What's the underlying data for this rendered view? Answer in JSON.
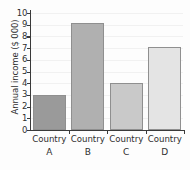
{
  "chart_data": {
    "type": "bar",
    "title": "",
    "subtitle": "",
    "xlabel": "",
    "ylabel": "Annual income ($ 000)",
    "categories": [
      "Country A",
      "Country B",
      "Country C",
      "Country D"
    ],
    "category_names": [
      "Country",
      "Country",
      "Country",
      "Country"
    ],
    "category_keys": [
      "A",
      "B",
      "C",
      "D"
    ],
    "values": [
      3.0,
      9.15,
      4.05,
      7.1
    ],
    "value_labels": [
      "3.0",
      "9.15",
      "4.05",
      "7.1"
    ],
    "bar_colors": [
      "#9a9a9a",
      "#b0b0b0",
      "#c9c9c9",
      "#e4e4e4"
    ],
    "bar_border_color": "#8f8f8f",
    "ylim": [
      0,
      10
    ],
    "ytick_values": [
      0,
      1,
      2,
      3,
      4,
      5,
      6,
      7,
      8,
      9,
      10
    ],
    "ytick_labels": [
      "0",
      "1",
      "2",
      "3",
      "4",
      "5",
      "6",
      "7",
      "8",
      "9",
      "10"
    ],
    "grid": "faint-horizontal",
    "legend": "none",
    "legend_position": "none",
    "axis_color": "#3a3a3a",
    "background_color": "#fdfdfd",
    "annotations": []
  }
}
